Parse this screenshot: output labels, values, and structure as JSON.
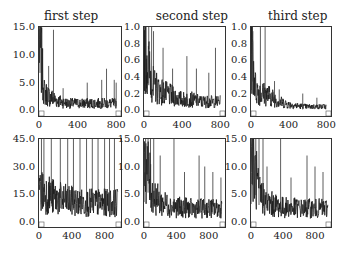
{
  "chart_data": [
    {
      "type": "line",
      "title": "first step",
      "row": 0,
      "col": 0,
      "xlim": [
        0,
        850
      ],
      "ylim": [
        -1.0,
        15.0
      ],
      "xticks": [
        0,
        400,
        800
      ],
      "xtick_labels": [
        "0",
        "400",
        "800"
      ],
      "yticks": [
        0.0,
        5.0,
        10.0,
        15.0
      ],
      "ytick_labels": [
        "0.0",
        "5.0",
        "10.0",
        "15.0"
      ],
      "description": "Noisy decaying series: starts ~15, drops quickly to ~2-4 by x=100, noisy floor ~1 with spikes up to ~14 near x=150, ~8 near x=100, ~6-7 near x=650-700",
      "envelope": {
        "x": [
          0,
          20,
          50,
          100,
          200,
          300,
          400,
          500,
          600,
          700,
          800
        ],
        "y": [
          15.0,
          12.0,
          4.0,
          3.0,
          2.0,
          1.5,
          1.5,
          1.5,
          1.5,
          1.5,
          1.5
        ]
      },
      "spikes": [
        [
          10,
          15.0
        ],
        [
          25,
          14.0
        ],
        [
          100,
          8.0
        ],
        [
          150,
          14.5
        ],
        [
          250,
          4.0
        ],
        [
          500,
          5.0
        ],
        [
          650,
          5.5
        ],
        [
          700,
          7.5
        ],
        [
          780,
          5.5
        ],
        [
          800,
          5.0
        ]
      ]
    },
    {
      "type": "line",
      "title": "second step",
      "row": 0,
      "col": 1,
      "xlim": [
        0,
        850
      ],
      "ylim": [
        -0.07,
        1.0
      ],
      "xticks": [
        0,
        400,
        800
      ],
      "xtick_labels": [
        "0",
        "400",
        "800"
      ],
      "yticks": [
        0.0,
        0.2,
        0.4,
        0.6,
        0.8,
        1.0
      ],
      "ytick_labels": [
        "0.0",
        "0.2",
        "0.4",
        "0.6",
        "0.8",
        "1.0"
      ],
      "description": "Noisy decaying series starting at 1.0, decaying to a noisy floor around 0.1 with frequent spikes to 0.3-0.7",
      "envelope": {
        "x": [
          0,
          50,
          100,
          200,
          300,
          400,
          500,
          600,
          700,
          800
        ],
        "y": [
          1.0,
          0.6,
          0.35,
          0.25,
          0.2,
          0.15,
          0.15,
          0.12,
          0.12,
          0.12
        ]
      },
      "spikes": [
        [
          20,
          1.0
        ],
        [
          50,
          1.0
        ],
        [
          80,
          1.0
        ],
        [
          100,
          0.95
        ],
        [
          200,
          0.75
        ],
        [
          300,
          0.5
        ],
        [
          450,
          0.65
        ],
        [
          550,
          0.5
        ],
        [
          680,
          0.45
        ],
        [
          750,
          0.75
        ]
      ]
    },
    {
      "type": "line",
      "title": "third step",
      "row": 0,
      "col": 2,
      "xlim": [
        0,
        850
      ],
      "ylim": [
        -0.07,
        1.0
      ],
      "xticks": [
        0,
        400,
        800
      ],
      "xtick_labels": [
        "0",
        "400",
        "800"
      ],
      "yticks": [
        0.0,
        0.2,
        0.4,
        0.6,
        0.8,
        1.0
      ],
      "ytick_labels": [
        "0.0",
        "0.2",
        "0.4",
        "0.6",
        "0.8",
        "1.0"
      ],
      "description": "Decaying series with a few tall spikes to 1.0 early, floor ~0.05 after x=400",
      "envelope": {
        "x": [
          0,
          50,
          100,
          200,
          300,
          400,
          500,
          600,
          700,
          800
        ],
        "y": [
          0.95,
          0.3,
          0.25,
          0.2,
          0.12,
          0.08,
          0.06,
          0.05,
          0.05,
          0.05
        ]
      },
      "spikes": [
        [
          20,
          0.95
        ],
        [
          100,
          1.0
        ],
        [
          150,
          1.0
        ],
        [
          250,
          0.35
        ],
        [
          300,
          0.25
        ],
        [
          550,
          0.2
        ],
        [
          700,
          0.15
        ]
      ]
    },
    {
      "type": "line",
      "row": 1,
      "col": 0,
      "xlim": [
        0,
        1000
      ],
      "ylim": [
        -3.0,
        45.0
      ],
      "xticks": [
        0,
        400,
        800
      ],
      "xtick_labels": [
        "0",
        "400",
        "800"
      ],
      "yticks": [
        0.0,
        15.0,
        30.0,
        45.0
      ],
      "ytick_labels": [
        "0.0",
        "15.0",
        "30.0",
        "45.0"
      ],
      "description": "Very noisy series, band ~5-25 with many spikes hitting 45",
      "envelope": {
        "x": [
          0,
          100,
          200,
          300,
          400,
          500,
          600,
          700,
          800,
          900,
          1000
        ],
        "y": [
          20,
          18,
          15,
          14,
          13,
          12,
          12,
          12,
          12,
          12,
          12
        ]
      },
      "spikes": [
        [
          30,
          45
        ],
        [
          60,
          45
        ],
        [
          150,
          45
        ],
        [
          260,
          45
        ],
        [
          350,
          45
        ],
        [
          420,
          45
        ],
        [
          500,
          45
        ],
        [
          580,
          45
        ],
        [
          650,
          45
        ],
        [
          720,
          45
        ],
        [
          800,
          45
        ],
        [
          860,
          45
        ],
        [
          920,
          45
        ]
      ]
    },
    {
      "type": "line",
      "row": 1,
      "col": 1,
      "xlim": [
        0,
        1000
      ],
      "ylim": [
        -1.0,
        15.0
      ],
      "xticks": [
        0,
        400,
        800
      ],
      "xtick_labels": [
        "0",
        "400",
        "800"
      ],
      "yticks": [
        0.0,
        5.0,
        10.0,
        15.0
      ],
      "ytick_labels": [
        "0.0",
        "5.0",
        "10.0",
        "15.0"
      ],
      "description": "Noisy series starting ~15 decaying to band ~1-5 with spikes to ~9-12",
      "envelope": {
        "x": [
          0,
          100,
          200,
          300,
          400,
          500,
          600,
          700,
          800,
          900,
          1000
        ],
        "y": [
          15,
          6,
          4,
          3.5,
          3,
          3,
          2.8,
          2.8,
          2.8,
          2.8,
          2.8
        ]
      },
      "spikes": [
        [
          20,
          15
        ],
        [
          50,
          15
        ],
        [
          80,
          15
        ],
        [
          120,
          15
        ],
        [
          200,
          12
        ],
        [
          370,
          15
        ],
        [
          500,
          9
        ],
        [
          680,
          12
        ],
        [
          750,
          10
        ],
        [
          850,
          9
        ],
        [
          950,
          8
        ]
      ]
    },
    {
      "type": "line",
      "row": 1,
      "col": 2,
      "xlim": [
        0,
        1000
      ],
      "ylim": [
        -1.0,
        15.0
      ],
      "xticks": [
        0,
        400,
        800
      ],
      "xtick_labels": [
        "0",
        "400",
        "800"
      ],
      "yticks": [
        0.0,
        5.0,
        10.0,
        15.0
      ],
      "ytick_labels": [
        "0.0",
        "5.0",
        "10.0",
        "15.0"
      ],
      "description": "Noisy series starting ~15 decaying to band ~1-5 with spikes to ~8-12",
      "envelope": {
        "x": [
          0,
          100,
          200,
          300,
          400,
          500,
          600,
          700,
          800,
          900,
          1000
        ],
        "y": [
          15,
          6,
          4,
          3.5,
          3,
          3,
          2.8,
          2.8,
          2.8,
          2.8,
          2.8
        ]
      },
      "spikes": [
        [
          20,
          15
        ],
        [
          60,
          15
        ],
        [
          100,
          15
        ],
        [
          150,
          15
        ],
        [
          200,
          10
        ],
        [
          370,
          15
        ],
        [
          500,
          8
        ],
        [
          700,
          12
        ],
        [
          800,
          10
        ],
        [
          900,
          9
        ]
      ]
    }
  ],
  "panels": [
    {
      "title": "first step",
      "yticks": [
        "15.0",
        "10.0",
        "5.0",
        "0.0"
      ],
      "xticks": [
        "0",
        "400",
        "800"
      ]
    },
    {
      "title": "second step",
      "yticks": [
        "1.0",
        "0.8",
        "0.6",
        "0.4",
        "0.2",
        "0.0"
      ],
      "xticks": [
        "0",
        "400",
        "800"
      ]
    },
    {
      "title": "third step",
      "yticks": [
        "1.0",
        "0.8",
        "0.6",
        "0.4",
        "0.2",
        "0.0"
      ],
      "xticks": [
        "0",
        "400",
        "800"
      ]
    },
    {
      "title": "",
      "yticks": [
        "45.0",
        "30.0",
        "15.0",
        "0.0"
      ],
      "xticks": [
        "0",
        "400",
        "800"
      ]
    },
    {
      "title": "",
      "yticks": [
        "15.0",
        "10.0",
        "5.0",
        "0.0"
      ],
      "xticks": [
        "0",
        "400",
        "800"
      ]
    },
    {
      "title": "",
      "yticks": [
        "15.0",
        "10.0",
        "5.0",
        "0.0"
      ],
      "xticks": [
        "0",
        "400",
        "800"
      ]
    }
  ]
}
